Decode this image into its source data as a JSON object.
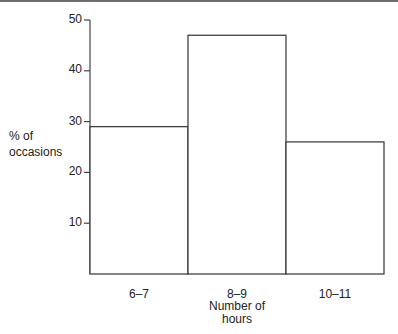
{
  "chart_data": {
    "type": "bar",
    "title": "",
    "xlabel": "Number of hours",
    "ylabel": "% of occasions",
    "categories": [
      "6–7",
      "8–9",
      "10–11"
    ],
    "values": [
      29,
      47,
      26
    ],
    "ylim": [
      0,
      50
    ],
    "yticks": [
      10,
      20,
      30,
      40,
      50
    ],
    "grid": false,
    "legend": null,
    "style": "histogram, unfilled bars with black outlines"
  },
  "labels": {
    "ylabel_line1": "% of",
    "ylabel_line2": "occasions",
    "xlabel_line1": "Number of",
    "xlabel_line2": "hours",
    "yticks": [
      "50",
      "40",
      "30",
      "20",
      "10"
    ],
    "categories": [
      "6–7",
      "8–9",
      "10–11"
    ]
  },
  "colors": {
    "axis": "#444444",
    "bar_outline": "#333333",
    "bar_fill": "#ffffff",
    "top_rule": "#6e6e6e"
  }
}
